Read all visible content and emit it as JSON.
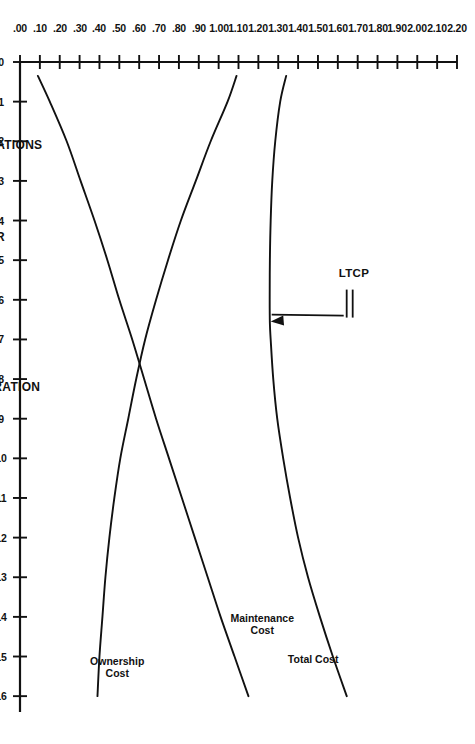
{
  "chart_data": {
    "type": "line",
    "title": "",
    "subtitle": "",
    "orientation": "rotated-90-clockwise",
    "xlabel": "HOURS OF OPERATION",
    "xlabel_secondary": "HOURS OF OPERATIONS",
    "ylabel": "COST PER HOUR",
    "xlim": [
      0,
      16.4
    ],
    "ylim": [
      0.0,
      2.2
    ],
    "grid": false,
    "legend_position": "inline-curve-labels",
    "x_ticks": [
      0,
      1,
      2,
      3,
      4,
      5,
      6,
      7,
      8,
      9,
      10,
      11,
      12,
      13,
      14,
      15,
      16
    ],
    "x_tick_labels": [
      "0",
      "1",
      "2",
      "3",
      "4",
      "5",
      "6",
      "7",
      "8",
      "9",
      "10",
      "11",
      "12",
      "13",
      "14",
      "15",
      "16"
    ],
    "y_ticks": [
      0.0,
      0.1,
      0.2,
      0.3,
      0.4,
      0.5,
      0.6,
      0.7,
      0.8,
      0.9,
      1.0,
      1.1,
      1.2,
      1.3,
      1.4,
      1.5,
      1.6,
      1.7,
      1.8,
      1.9,
      2.0,
      2.1,
      2.2
    ],
    "y_tick_labels": [
      ".00",
      ".10",
      ".20",
      ".30",
      ".40",
      ".50",
      ".60",
      ".70",
      ".80",
      ".90",
      "1.00",
      "1.10",
      "1.20",
      "1.30",
      "1.40",
      "1.50",
      "1.60",
      "1.70",
      "1.80",
      "1.90",
      "2.00",
      "2.10",
      "2.20"
    ],
    "series": [
      {
        "name": "Total Cost",
        "label": "Total Cost",
        "x": [
          0.35,
          1,
          2,
          3,
          4,
          5,
          6,
          6.6,
          7,
          8,
          9,
          10,
          11,
          12,
          13,
          14,
          15,
          16
        ],
        "values": [
          1.34,
          1.31,
          1.285,
          1.27,
          1.262,
          1.258,
          1.257,
          1.258,
          1.262,
          1.275,
          1.295,
          1.325,
          1.36,
          1.4,
          1.45,
          1.51,
          1.575,
          1.645
        ]
      },
      {
        "name": "Maintenance Cost",
        "label": "Maintenance Cost",
        "x": [
          0.35,
          1,
          2,
          3,
          4,
          5,
          6,
          7,
          8,
          9,
          10,
          11,
          12,
          13,
          14,
          15,
          16
        ],
        "values": [
          0.09,
          0.15,
          0.235,
          0.305,
          0.375,
          0.44,
          0.5,
          0.565,
          0.625,
          0.685,
          0.75,
          0.815,
          0.88,
          0.945,
          1.01,
          1.08,
          1.15
        ]
      },
      {
        "name": "Ownership Cost",
        "label": "Ownership Cost",
        "x": [
          0.35,
          1,
          2,
          3,
          4,
          5,
          6,
          7,
          8,
          9,
          10,
          11,
          12,
          13,
          14,
          15,
          16
        ],
        "values": [
          1.09,
          1.045,
          0.96,
          0.885,
          0.81,
          0.745,
          0.685,
          0.63,
          0.585,
          0.545,
          0.505,
          0.475,
          0.45,
          0.43,
          0.415,
          0.4,
          0.39
        ]
      }
    ],
    "annotations": [
      {
        "name": "LTCP",
        "text": "LTCP",
        "points_to_x": 6.6,
        "points_to_y": 1.257,
        "description": "Arrow marking the minimum of the Total Cost curve"
      }
    ],
    "crossover": {
      "description": "Maintenance Cost and Ownership Cost intersect",
      "x": 8.7,
      "y": 0.52
    }
  },
  "axes": {
    "cost_axis_title": "COST PER HOUR",
    "hours_axis_title": "HOURS OF OPERATION",
    "hours_axis_title_alt": "HOURS OF OPERATIONS"
  },
  "curve_labels": {
    "total_cost": "Total Cost",
    "maintenance_cost_line1": "Maintenance",
    "maintenance_cost_line2": "Cost",
    "ownership_cost_line1": "Ownership",
    "ownership_cost_line2": "Cost"
  },
  "callout": {
    "ltcp": "LTCP"
  },
  "colors": {
    "ink": "#111111",
    "paper": "#ffffff"
  }
}
